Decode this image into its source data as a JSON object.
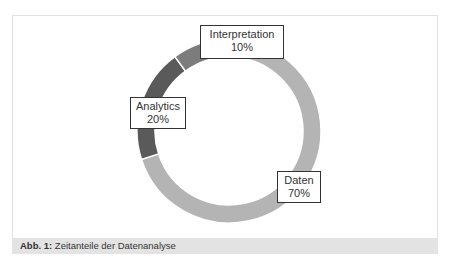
{
  "chart_data": {
    "type": "pie",
    "variant": "donut",
    "title": "",
    "caption_prefix": "Abb. 1:",
    "caption_text": " Zeitanteile der Datenanalyse",
    "categories": [
      "Daten",
      "Analytics",
      "Interpretation"
    ],
    "values": [
      70,
      20,
      10
    ],
    "labels": [
      "70%",
      "20%",
      "10%"
    ],
    "colors": [
      "#b4b4b4",
      "#5a5a5a",
      "#7c7c7c"
    ],
    "start_angle_deg": 0,
    "direction": "clockwise",
    "legend": "none",
    "data_labels": "callout boxes with category name and percent"
  },
  "labels": {
    "daten": {
      "name": "Daten",
      "pct": "70%"
    },
    "analytics": {
      "name": "Analytics",
      "pct": "20%"
    },
    "interpretation": {
      "name": "Interpretation",
      "pct": "10%"
    }
  },
  "caption": {
    "prefix": "Abb. 1:",
    "text": " Zeitanteile der Datenanalyse"
  }
}
